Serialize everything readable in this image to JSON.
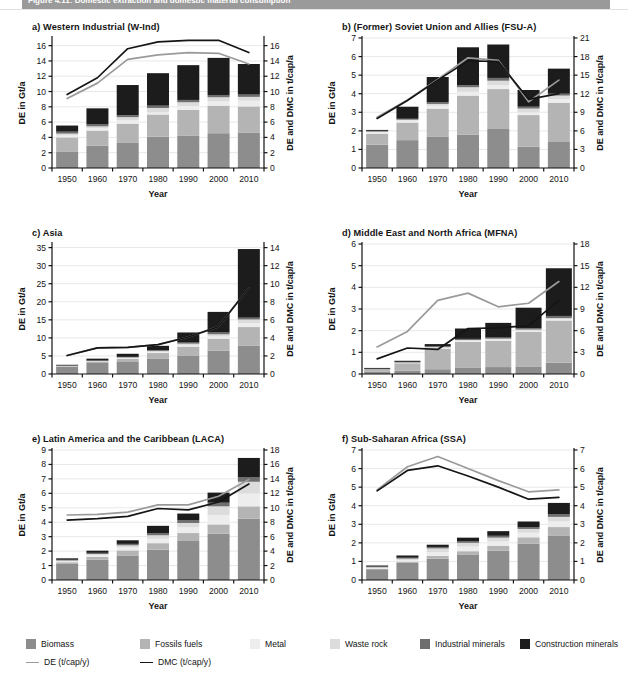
{
  "figure": {
    "banner_title": "Figure 4.11: Domestic extraction and domestic material consumption",
    "x_axis_label": "Year",
    "y_left_label": "DE in Gt/a",
    "y_right_label": "DE and DMC in t/cap/a",
    "years": [
      1950,
      1960,
      1970,
      1980,
      1990,
      2000,
      2010
    ]
  },
  "colors": {
    "biomass": "#8d8d8d",
    "fossils_fuels": "#b4b4b4",
    "metal": "#ededed",
    "waste_rock": "#dcdcdc",
    "industrial_minerals": "#6e6e6e",
    "construction_minerals": "#1c1c1c",
    "de_line": "#9a9a9a",
    "dmc_line": "#151515",
    "grid": "#e8e8e8",
    "axis": "#111111",
    "banner": "#9a9a9a"
  },
  "legend": {
    "swatches": [
      {
        "label": "Biomass",
        "key": "biomass"
      },
      {
        "label": "Fossils fuels",
        "key": "fossils_fuels"
      },
      {
        "label": "Metal",
        "key": "metal"
      },
      {
        "label": "Waste rock",
        "key": "waste_rock"
      },
      {
        "label": "Industrial minerals",
        "key": "industrial_minerals"
      },
      {
        "label": "Construction minerals",
        "key": "construction_minerals"
      }
    ],
    "lines": [
      {
        "label": "DE (t/cap/y)",
        "key": "de_line"
      },
      {
        "label": "DMC (t/cap/y)",
        "key": "dmc_line"
      }
    ]
  },
  "chart_data": [
    {
      "id": "a",
      "type": "bar",
      "title": "a) Western Industrial (W-Ind)",
      "xlabel": "Year",
      "ylabel": "DE in Gt/a",
      "y2label": "DE and DMC in t/cap/a",
      "categories": [
        1950,
        1960,
        1970,
        1980,
        1990,
        2000,
        2010
      ],
      "ylim": [
        0,
        17
      ],
      "yticks": [
        0,
        2,
        4,
        6,
        8,
        10,
        12,
        14,
        16
      ],
      "y2lim": [
        0,
        17
      ],
      "y2ticks": [
        0,
        2,
        4,
        6,
        8,
        10,
        12,
        14,
        16
      ],
      "grid": true,
      "legend_position": "bottom",
      "series": [
        {
          "name": "Biomass",
          "values": [
            2.1,
            2.9,
            3.35,
            4.1,
            4.2,
            4.55,
            4.65
          ]
        },
        {
          "name": "Fossils fuels",
          "values": [
            1.9,
            2.0,
            2.45,
            2.9,
            3.4,
            3.6,
            3.4
          ]
        },
        {
          "name": "Metal",
          "values": [
            0.25,
            0.3,
            0.45,
            0.25,
            0.5,
            0.55,
            0.75
          ]
        },
        {
          "name": "Waste rock",
          "values": [
            0.25,
            0.25,
            0.4,
            0.6,
            0.5,
            0.55,
            0.5
          ]
        },
        {
          "name": "Industrial minerals",
          "values": [
            0.25,
            0.25,
            0.25,
            0.3,
            0.3,
            0.3,
            0.3
          ]
        },
        {
          "name": "Construction minerals",
          "values": [
            0.8,
            2.1,
            3.95,
            4.25,
            4.55,
            4.85,
            4.0
          ]
        }
      ],
      "lines": [
        {
          "name": "DE (t/cap/y)",
          "x": [
            1950,
            1960,
            1970,
            1980,
            1990,
            2000,
            2010
          ],
          "values": [
            9.1,
            11.1,
            14.2,
            14.8,
            15.1,
            15.0,
            13.6
          ]
        },
        {
          "name": "DMC (t/cap/y)",
          "x": [
            1950,
            1960,
            1970,
            1980,
            1990,
            2000,
            2010
          ],
          "values": [
            9.6,
            11.8,
            15.6,
            16.5,
            16.7,
            16.7,
            15.1
          ]
        }
      ]
    },
    {
      "id": "b",
      "type": "bar",
      "title": "b) (Former) Soviet Union and Allies (FSU-A)",
      "xlabel": "Year",
      "ylabel": "DE in Gt/a",
      "y2label": "DE and DMC in t/cap/a",
      "categories": [
        1950,
        1960,
        1970,
        1980,
        1990,
        2000,
        2010
      ],
      "ylim": [
        0,
        7
      ],
      "yticks": [
        0,
        1,
        2,
        3,
        4,
        5,
        6,
        7
      ],
      "y2lim": [
        0,
        21
      ],
      "y2ticks": [
        0,
        3,
        6,
        9,
        12,
        15,
        18,
        21
      ],
      "grid": true,
      "legend_position": "bottom",
      "series": [
        {
          "name": "Biomass",
          "values": [
            1.25,
            1.5,
            1.7,
            1.8,
            2.1,
            1.15,
            1.4
          ]
        },
        {
          "name": "Fossils fuels",
          "values": [
            0.6,
            0.95,
            1.5,
            2.1,
            2.15,
            1.7,
            2.1
          ]
        },
        {
          "name": "Metal",
          "values": [
            0.08,
            0.1,
            0.15,
            0.2,
            0.2,
            0.15,
            0.2
          ]
        },
        {
          "name": "Waste rock",
          "values": [
            0.03,
            0.05,
            0.1,
            0.25,
            0.25,
            0.2,
            0.2
          ]
        },
        {
          "name": "Industrial minerals",
          "values": [
            0.04,
            0.05,
            0.1,
            0.1,
            0.15,
            0.1,
            0.1
          ]
        },
        {
          "name": "Construction minerals",
          "values": [
            0.05,
            0.65,
            1.35,
            2.05,
            1.8,
            0.9,
            1.35
          ]
        }
      ],
      "lines": [
        {
          "name": "DE (t/cap/y)",
          "x": [
            1950,
            1960,
            1970,
            1980,
            1990,
            2000,
            2010
          ],
          "values": [
            8.2,
            11.0,
            14.3,
            17.8,
            17.4,
            10.7,
            14.2
          ]
        },
        {
          "name": "DMC (t/cap/y)",
          "x": [
            1950,
            1960,
            1970,
            1980,
            1990,
            2000,
            2010
          ],
          "values": [
            8.0,
            10.9,
            14.2,
            17.3,
            17.2,
            11.1,
            12.0
          ]
        }
      ]
    },
    {
      "id": "c",
      "type": "bar",
      "title": "c) Asia",
      "xlabel": "Year",
      "ylabel": "DE in Gt/a",
      "y2label": "DE and DMC in t/cap/a",
      "categories": [
        1950,
        1960,
        1970,
        1980,
        1990,
        2000,
        2010
      ],
      "ylim": [
        0,
        36
      ],
      "yticks": [
        0,
        5,
        10,
        15,
        20,
        25,
        30,
        35
      ],
      "y2lim": [
        0,
        14.4
      ],
      "y2ticks": [
        0,
        2,
        4,
        6,
        8,
        10,
        12,
        14
      ],
      "grid": true,
      "legend_position": "bottom",
      "series": [
        {
          "name": "Biomass",
          "values": [
            2.1,
            3.05,
            3.5,
            4.2,
            5.0,
            6.5,
            7.8
          ]
        },
        {
          "name": "Fossils fuels",
          "values": [
            0.15,
            0.4,
            0.7,
            1.6,
            2.6,
            3.3,
            5.2
          ]
        },
        {
          "name": "Metal",
          "values": [
            0.05,
            0.1,
            0.2,
            0.3,
            0.4,
            0.6,
            1.1
          ]
        },
        {
          "name": "Waste rock",
          "values": [
            0.05,
            0.1,
            0.2,
            0.3,
            0.4,
            0.6,
            1.0
          ]
        },
        {
          "name": "Industrial minerals",
          "values": [
            0.05,
            0.1,
            0.15,
            0.25,
            0.3,
            0.5,
            0.5
          ]
        },
        {
          "name": "Construction minerals",
          "values": [
            0.15,
            0.5,
            0.85,
            1.15,
            2.8,
            5.7,
            19.0
          ]
        }
      ],
      "lines": [
        {
          "name": "DE (t/cap/y)",
          "x": [
            1950,
            1960,
            1970,
            1980,
            1990,
            2000,
            2010
          ],
          "values": [
            2.05,
            2.9,
            2.95,
            3.25,
            4.1,
            5.25,
            9.55
          ]
        },
        {
          "name": "DMC (t/cap/y)",
          "x": [
            1950,
            1960,
            1970,
            1980,
            1990,
            2000,
            2010
          ],
          "values": [
            2.05,
            2.9,
            2.95,
            3.25,
            4.1,
            5.25,
            9.55
          ]
        }
      ]
    },
    {
      "id": "d",
      "type": "bar",
      "title": "d) Middle East and North Africa (MFNA)",
      "xlabel": "Year",
      "ylabel": "DE in Gt/a",
      "y2label": "DE and DMC in t/cap/a",
      "categories": [
        1950,
        1960,
        1970,
        1980,
        1990,
        2000,
        2010
      ],
      "ylim": [
        0,
        6
      ],
      "yticks": [
        0,
        1,
        2,
        3,
        4,
        5,
        6
      ],
      "y2lim": [
        0,
        18
      ],
      "y2ticks": [
        0,
        3,
        6,
        9,
        12,
        15,
        18
      ],
      "grid": true,
      "legend_position": "bottom",
      "series": [
        {
          "name": "Biomass",
          "values": [
            0.1,
            0.15,
            0.22,
            0.28,
            0.32,
            0.35,
            0.52
          ]
        },
        {
          "name": "Fossils fuels",
          "values": [
            0.1,
            0.35,
            0.95,
            1.2,
            1.22,
            1.6,
            1.95
          ]
        },
        {
          "name": "Metal",
          "values": [
            0.01,
            0.02,
            0.04,
            0.05,
            0.05,
            0.05,
            0.06
          ]
        },
        {
          "name": "Waste rock",
          "values": [
            0.01,
            0.02,
            0.03,
            0.04,
            0.04,
            0.05,
            0.05
          ]
        },
        {
          "name": "Industrial minerals",
          "values": [
            0.02,
            0.02,
            0.04,
            0.05,
            0.05,
            0.06,
            0.1
          ]
        },
        {
          "name": "Construction minerals",
          "values": [
            0.04,
            0.05,
            0.1,
            0.48,
            0.68,
            0.95,
            2.2
          ]
        }
      ],
      "lines": [
        {
          "name": "DE (t/cap/y)",
          "x": [
            1950,
            1960,
            1970,
            1980,
            1990,
            2000,
            2010
          ],
          "values": [
            3.75,
            5.9,
            10.2,
            11.2,
            9.3,
            9.8,
            12.8
          ]
        },
        {
          "name": "DMC (t/cap/y)",
          "x": [
            1950,
            1960,
            1970,
            1980,
            1990,
            2000,
            2010
          ],
          "values": [
            2.1,
            3.6,
            3.4,
            6.3,
            6.4,
            6.7,
            10.2
          ]
        }
      ]
    },
    {
      "id": "e",
      "type": "bar",
      "title": "e) Latin America and the Caribbean (LACA)",
      "xlabel": "Year",
      "ylabel": "DE in Gt/a",
      "y2label": "DE and DMC in t/cap/a",
      "categories": [
        1950,
        1960,
        1970,
        1980,
        1990,
        2000,
        2010
      ],
      "ylim": [
        0,
        9
      ],
      "yticks": [
        0,
        1,
        2,
        3,
        4,
        5,
        6,
        7,
        8,
        9
      ],
      "y2lim": [
        0,
        18
      ],
      "y2ticks": [
        0,
        2,
        4,
        6,
        8,
        10,
        12,
        14,
        16,
        18
      ],
      "grid": true,
      "legend_position": "bottom",
      "series": [
        {
          "name": "Biomass",
          "values": [
            1.15,
            1.4,
            1.7,
            2.1,
            2.7,
            3.2,
            4.25
          ]
        },
        {
          "name": "Fossils fuels",
          "values": [
            0.08,
            0.2,
            0.35,
            0.45,
            0.55,
            0.65,
            0.85
          ]
        },
        {
          "name": "Metal",
          "values": [
            0.06,
            0.1,
            0.2,
            0.3,
            0.4,
            0.65,
            0.9
          ]
        },
        {
          "name": "Waste rock",
          "values": [
            0.06,
            0.1,
            0.15,
            0.25,
            0.3,
            0.6,
            0.8
          ]
        },
        {
          "name": "Industrial minerals",
          "values": [
            0.05,
            0.08,
            0.1,
            0.15,
            0.2,
            0.25,
            0.3
          ]
        },
        {
          "name": "Construction minerals",
          "values": [
            0.1,
            0.15,
            0.25,
            0.5,
            0.45,
            0.7,
            1.35
          ]
        }
      ],
      "lines": [
        {
          "name": "DE (t/cap/y)",
          "x": [
            1950,
            1960,
            1970,
            1980,
            1990,
            2000,
            2010
          ],
          "values": [
            9.0,
            9.1,
            9.4,
            10.4,
            10.4,
            11.6,
            13.9
          ]
        },
        {
          "name": "DMC (t/cap/y)",
          "x": [
            1950,
            1960,
            1970,
            1980,
            1990,
            2000,
            2010
          ],
          "values": [
            8.3,
            8.5,
            8.8,
            9.9,
            9.7,
            10.8,
            13.3
          ]
        }
      ]
    },
    {
      "id": "f",
      "type": "bar",
      "title": "f) Sub-Saharan Africa (SSA)",
      "xlabel": "Year",
      "ylabel": "DE in Gt/a",
      "y2label": "DE and DMC in t/cap/a",
      "categories": [
        1950,
        1960,
        1970,
        1980,
        1990,
        2000,
        2010
      ],
      "ylim": [
        0,
        7
      ],
      "yticks": [
        0,
        1,
        2,
        3,
        4,
        5,
        6,
        7
      ],
      "y2lim": [
        0,
        7
      ],
      "y2ticks": [
        0,
        1,
        2,
        3,
        4,
        5,
        6,
        7
      ],
      "grid": true,
      "legend_position": "bottom",
      "series": [
        {
          "name": "Biomass",
          "values": [
            0.58,
            0.92,
            1.15,
            1.35,
            1.58,
            1.95,
            2.4
          ]
        },
        {
          "name": "Fossils fuels",
          "values": [
            0.03,
            0.07,
            0.15,
            0.2,
            0.25,
            0.35,
            0.45
          ]
        },
        {
          "name": "Metal",
          "values": [
            0.04,
            0.08,
            0.2,
            0.25,
            0.25,
            0.25,
            0.3
          ]
        },
        {
          "name": "Waste rock",
          "values": [
            0.04,
            0.08,
            0.2,
            0.2,
            0.2,
            0.2,
            0.25
          ]
        },
        {
          "name": "Industrial minerals",
          "values": [
            0.03,
            0.05,
            0.08,
            0.1,
            0.1,
            0.1,
            0.15
          ]
        },
        {
          "name": "Construction minerals",
          "values": [
            0.06,
            0.12,
            0.12,
            0.18,
            0.25,
            0.3,
            0.6
          ]
        }
      ],
      "lines": [
        {
          "name": "DE (t/cap/y)",
          "x": [
            1950,
            1960,
            1970,
            1980,
            1990,
            2000,
            2010
          ],
          "values": [
            4.85,
            6.1,
            6.65,
            6.0,
            5.35,
            4.75,
            4.85
          ]
        },
        {
          "name": "DMC (t/cap/y)",
          "x": [
            1950,
            1960,
            1970,
            1980,
            1990,
            2000,
            2010
          ],
          "values": [
            4.8,
            5.9,
            6.15,
            5.6,
            5.0,
            4.35,
            4.45
          ]
        }
      ]
    }
  ]
}
